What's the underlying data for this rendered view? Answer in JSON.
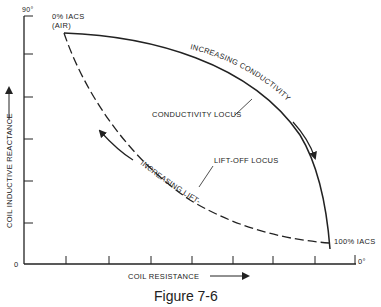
{
  "figure": {
    "caption": "Figure 7-6",
    "y_axis": {
      "label": "COIL INDUCTIVE REACTANCE",
      "top_label": "90°",
      "origin_label": "0"
    },
    "x_axis": {
      "label": "COIL RESISTANCE",
      "end_label": "0°"
    },
    "points": {
      "air": {
        "line1": "0% IACS",
        "line2": "(AIR)"
      },
      "copper": "100% IACS"
    },
    "curves": {
      "conductivity_locus": "CONDUCTIVITY LOCUS",
      "liftoff_locus": "LIFT-OFF LOCUS"
    },
    "arrows": {
      "increasing_conductivity": "INCREASING CONDUCTIVITY",
      "increasing_liftoff": "INCREASING LIFT-OFF"
    },
    "colors": {
      "ink": "#222222",
      "background": "#ffffff"
    }
  }
}
